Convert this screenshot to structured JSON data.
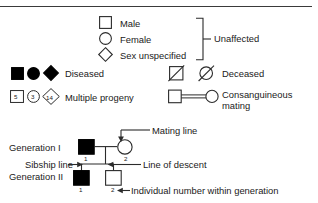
{
  "figure": {
    "kind": "pedigree-chart-legend",
    "stroke_color": "#2b2b2b",
    "fill_affected": "#000000",
    "fill_unaffected": "#ffffff",
    "text_color": "#1a1a1a"
  },
  "legend": {
    "unaffected_group": {
      "items": [
        {
          "symbol": "square",
          "label": "Male"
        },
        {
          "symbol": "circle",
          "label": "Female"
        },
        {
          "symbol": "diamond",
          "label": "Sex unspecified"
        }
      ],
      "bracket_label": "Unaffected"
    },
    "diseased": {
      "label": "Diseased",
      "symbols": [
        "filled-square",
        "filled-circle",
        "filled-diamond"
      ]
    },
    "deceased": {
      "label": "Deceased",
      "symbols": [
        "slashed-square",
        "slashed-circle"
      ]
    },
    "multiple_progeny": {
      "label": "Multiple progeny",
      "symbols": [
        {
          "symbol": "square",
          "number": "5"
        },
        {
          "symbol": "circle",
          "number": "3"
        },
        {
          "symbol": "diamond",
          "number": "14"
        }
      ]
    },
    "consanguineous": {
      "label_line1": "Consanguineous",
      "label_line2": "mating",
      "symbols": [
        "square",
        "circle"
      ]
    }
  },
  "pedigree": {
    "generation_one_label": "Generation I",
    "generation_two_label": "Generation II",
    "sibship_line_label": "Sibship line",
    "mating_line_label": "Mating line",
    "line_of_descent_label": "Line of descent",
    "individual_number_label": "Individual number within generation",
    "individuals": [
      {
        "generation": "I",
        "number": "1",
        "symbol": "filled-square"
      },
      {
        "generation": "I",
        "number": "2",
        "symbol": "circle"
      },
      {
        "generation": "II",
        "number": "1",
        "symbol": "filled-square"
      },
      {
        "generation": "II",
        "number": "2",
        "symbol": "square"
      }
    ]
  }
}
